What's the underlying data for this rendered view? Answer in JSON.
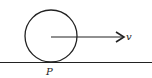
{
  "diagram": {
    "type": "rolling-wheel-physics",
    "labels": {
      "velocity": "v",
      "contact_point": "P"
    },
    "colors": {
      "stroke": "#222222",
      "background": "#ffffff"
    },
    "elements": [
      {
        "kind": "circle",
        "name": "wheel"
      },
      {
        "kind": "arrow",
        "name": "velocity-vector",
        "label": "v"
      },
      {
        "kind": "line",
        "name": "ground-surface"
      },
      {
        "kind": "point-label",
        "name": "contact-point",
        "label": "P"
      }
    ]
  }
}
